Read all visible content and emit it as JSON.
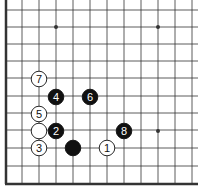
{
  "board": {
    "description": "Go board corner diagram (lower-left corner)",
    "colors": {
      "background": "#ffffff",
      "line": "#333333",
      "black_stone": "#111111",
      "white_stone": "#ffffff"
    },
    "grid": {
      "x_lines": [
        6,
        22,
        39,
        56,
        73,
        90,
        107,
        124,
        141,
        158,
        175,
        192
      ],
      "y_lines": [
        10,
        27,
        44,
        61,
        78,
        96,
        113,
        130,
        148,
        166
      ],
      "left_edge_x": 6,
      "bottom_edge_y": 184
    },
    "star_points": [
      {
        "x": 56,
        "y": 27
      },
      {
        "x": 158,
        "y": 27
      },
      {
        "x": 158,
        "y": 131
      }
    ],
    "stones": [
      {
        "color": "black",
        "label": "",
        "x": 73,
        "y": 148
      },
      {
        "color": "white",
        "label": "1",
        "x": 107,
        "y": 148
      },
      {
        "color": "black",
        "label": "2",
        "x": 56,
        "y": 131
      },
      {
        "color": "white",
        "label": "3",
        "x": 39,
        "y": 148
      },
      {
        "color": "black",
        "label": "4",
        "x": 56,
        "y": 97
      },
      {
        "color": "white",
        "label": "5",
        "x": 39,
        "y": 114
      },
      {
        "color": "black",
        "label": "6",
        "x": 90,
        "y": 97
      },
      {
        "color": "white",
        "label": "7",
        "x": 39,
        "y": 79
      },
      {
        "color": "black",
        "label": "8",
        "x": 124,
        "y": 131
      },
      {
        "color": "white",
        "label": "",
        "x": 39,
        "y": 131
      }
    ]
  }
}
